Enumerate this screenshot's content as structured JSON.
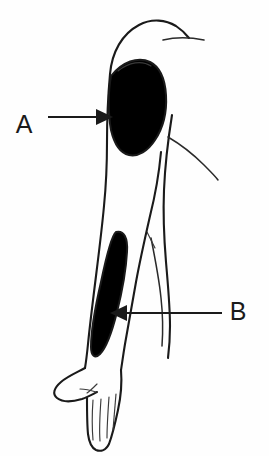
{
  "figure": {
    "background_color": "#fefefe",
    "outline_color": "#1a1a1a",
    "shade_color": "#c8cacb",
    "marker_color": "#141414",
    "width": 269,
    "height": 456
  },
  "labels": [
    {
      "id": "A",
      "text": "A",
      "x": 24,
      "y": 125,
      "points_to": "deltoid-injection-site",
      "arrow_direction": "right"
    },
    {
      "id": "B",
      "text": "B",
      "x": 232,
      "y": 303,
      "points_to": "forearm-shaded-region",
      "arrow_direction": "left"
    }
  ],
  "regions": [
    {
      "id": "deltoid-shaded-region",
      "name": "deltoid-shaded-region",
      "fill": "#c8cacb",
      "description": "Shaded deltoid muscle area on upper arm"
    },
    {
      "id": "deltoid-injection-site",
      "name": "injection-site-marker",
      "fill": "#141414",
      "description": "Solid black oval injection site marker within deltoid"
    },
    {
      "id": "forearm-shaded-region",
      "name": "forearm-shaded-region",
      "fill": "#c8cacb",
      "description": "Elongated shaded oval along the forearm"
    }
  ],
  "body_parts": [
    {
      "id": "shoulder",
      "name": "shoulder-contour"
    },
    {
      "id": "upper-arm",
      "name": "upper-arm-contour"
    },
    {
      "id": "elbow",
      "name": "elbow-contour"
    },
    {
      "id": "forearm",
      "name": "forearm-contour"
    },
    {
      "id": "hand",
      "name": "hand-contour"
    },
    {
      "id": "thumb",
      "name": "thumb-contour"
    },
    {
      "id": "fingers",
      "name": "finger-lines"
    },
    {
      "id": "torso",
      "name": "torso-contour"
    },
    {
      "id": "clavicle",
      "name": "clavicle-line"
    },
    {
      "id": "chest",
      "name": "chest-contour"
    }
  ]
}
